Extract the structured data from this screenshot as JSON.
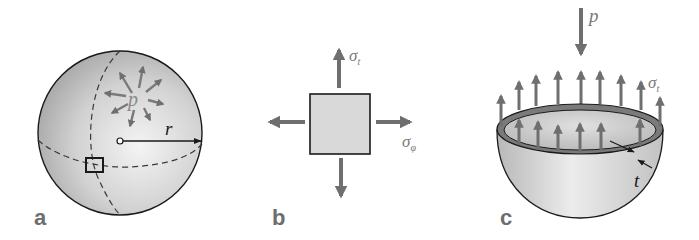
{
  "figure": {
    "panels": [
      {
        "id": "a",
        "label": "a",
        "description": "Sphere under internal pressure with surface element",
        "symbols": {
          "pressure": "p",
          "radius": "r"
        }
      },
      {
        "id": "b",
        "label": "b",
        "description": "Surface element with biaxial stresses",
        "symbols": {
          "sigma_t": "σ",
          "sigma_t_sub": "t",
          "sigma_phi": "σ",
          "sigma_phi_sub": "φ"
        }
      },
      {
        "id": "c",
        "label": "c",
        "description": "Hemisphere free-body with wall thickness",
        "symbols": {
          "pressure": "p",
          "sigma_t": "σ",
          "sigma_t_sub": "t",
          "thickness": "t"
        }
      }
    ],
    "colors": {
      "arrow": "#6f6f6f",
      "outline": "#1a1a1a",
      "sphere_light": "#f2f2f2",
      "sphere_dark": "#a8a8a8",
      "element_fill": "#d9d9d9",
      "label": "#6e6e6e"
    }
  }
}
